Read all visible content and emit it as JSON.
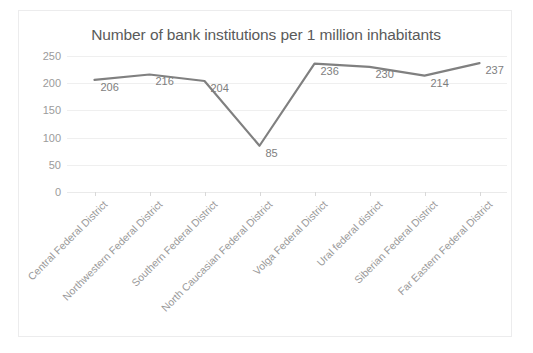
{
  "chart_data": {
    "type": "line",
    "title": "Number of bank institutions per 1 million inhabitants",
    "xlabel": "",
    "ylabel": "",
    "ylim": [
      0,
      250
    ],
    "yticks": [
      0,
      50,
      100,
      150,
      200,
      250
    ],
    "grid": true,
    "legend": "none",
    "series_color": "#808080",
    "categories": [
      "Central Federal District",
      "Northwestern Federal District",
      "Southern Federal District",
      "North Caucasian Federal District",
      "Volga Federal District",
      "Ural federal district",
      "Siberian Federal District",
      "Far Eastern Federal District"
    ],
    "values": [
      206,
      216,
      204,
      85,
      236,
      230,
      214,
      237
    ],
    "data_labels": [
      "206",
      "216",
      "204",
      "85",
      "236",
      "230",
      "214",
      "237"
    ]
  },
  "axis": {
    "ytick_labels": [
      "250",
      "200",
      "150",
      "100",
      "50",
      "0"
    ]
  },
  "colors": {
    "series": "#808080",
    "grid": "#efefef",
    "title_text": "#5a5a5a",
    "tick_text": "#9b9b9b",
    "border": "#ececed"
  }
}
